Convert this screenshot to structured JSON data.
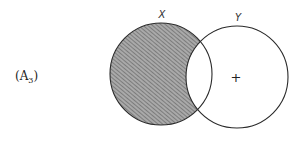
{
  "figure": {
    "label": "(A",
    "label_sub": "3",
    "label_close": ")"
  },
  "sets": {
    "x": {
      "name": "X",
      "shaded": true
    },
    "y": {
      "name": "Y",
      "shaded": false,
      "marker": "+"
    }
  },
  "colors": {
    "stroke": "#2a2a2a",
    "hatch": "#6b6b6b",
    "hatch_bg": "#a8a8a8"
  }
}
